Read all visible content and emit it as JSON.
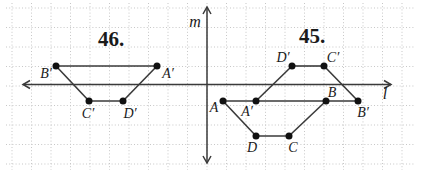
{
  "diagram": {
    "width": 422,
    "height": 174,
    "background": "#ffffff",
    "grid": {
      "spacing": 19.5,
      "offset_x": 12,
      "offset_y": 8,
      "x_min": 6,
      "x_max": 414,
      "y_min": 3,
      "y_max": 170,
      "color": "#c7c7c7"
    },
    "colors": {
      "line": "#3a3a3a",
      "dot": "#111111",
      "label": "#1a1a1a"
    },
    "axes": [
      {
        "name": "horizontal-axis-l",
        "label": "l",
        "x1": 23,
        "y1": 84.5,
        "x2": 391,
        "y2": 84.5,
        "label_x": 385,
        "label_y": 99
      },
      {
        "name": "vertical-axis-m",
        "label": "m",
        "x1": 207,
        "y1": 163,
        "x2": 207,
        "y2": 7,
        "label_x": 195,
        "label_y": 27
      }
    ],
    "figures": [
      {
        "name": "figure-46",
        "number": "46.",
        "number_x": 111,
        "number_y": 46,
        "points": [
          {
            "label": "B′",
            "x": 56,
            "y": 66,
            "lx": 46,
            "ly": 78
          },
          {
            "label": "A′",
            "x": 157,
            "y": 66,
            "lx": 168,
            "ly": 78
          },
          {
            "label": "C′",
            "x": 89,
            "y": 101,
            "lx": 88,
            "ly": 118
          },
          {
            "label": "D′",
            "x": 123,
            "y": 101,
            "lx": 130,
            "ly": 118
          }
        ],
        "segments": [
          [
            0,
            1
          ],
          [
            0,
            2
          ],
          [
            2,
            3
          ],
          [
            3,
            1
          ]
        ]
      },
      {
        "name": "figure-45",
        "number": "45.",
        "number_x": 312,
        "number_y": 43,
        "points": [
          {
            "label": "D′",
            "x": 292,
            "y": 66,
            "lx": 283,
            "ly": 62
          },
          {
            "label": "C′",
            "x": 324,
            "y": 66,
            "lx": 333,
            "ly": 62
          },
          {
            "label": "A",
            "x": 223,
            "y": 101,
            "lx": 214,
            "ly": 112
          },
          {
            "label": "A′",
            "x": 256,
            "y": 101,
            "lx": 247,
            "ly": 116
          },
          {
            "label": "B",
            "x": 326,
            "y": 101,
            "lx": 332,
            "ly": 97
          },
          {
            "label": "B′",
            "x": 358,
            "y": 101,
            "lx": 363,
            "ly": 117
          },
          {
            "label": "D",
            "x": 256,
            "y": 136,
            "lx": 252,
            "ly": 152
          },
          {
            "label": "C",
            "x": 289,
            "y": 136,
            "lx": 293,
            "ly": 152
          }
        ],
        "segments": [
          [
            0,
            1
          ],
          [
            0,
            3
          ],
          [
            1,
            5
          ],
          [
            2,
            5
          ],
          [
            2,
            6
          ],
          [
            6,
            7
          ],
          [
            7,
            4
          ]
        ]
      }
    ]
  }
}
